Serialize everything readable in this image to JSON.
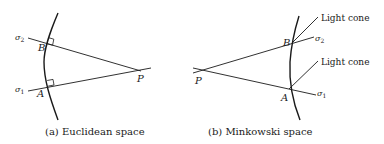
{
  "figure": {
    "panels": [
      {
        "id": "a",
        "caption": "(a) Euclidean space",
        "labels": {
          "point_B": "B",
          "point_A": "A",
          "point_P": "P",
          "sigma2": "σ",
          "sigma2_sub": "2",
          "sigma1": "σ",
          "sigma1_sub": "1"
        },
        "right_angle_markers": [
          "B",
          "A"
        ]
      },
      {
        "id": "b",
        "caption": "(b) Minkowski space",
        "labels": {
          "point_B": "B",
          "point_A": "A",
          "point_P": "P",
          "sigma2": "σ",
          "sigma2_sub": "2",
          "sigma1": "σ",
          "sigma1_sub": "1",
          "light_cone_upper": "Light cone",
          "light_cone_lower": "Light cone"
        }
      }
    ],
    "colors": {
      "ink": "#1a1a1a",
      "background": "#ffffff"
    }
  }
}
